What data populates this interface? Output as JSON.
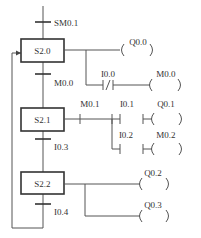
{
  "diagram": {
    "type": "SFC (sequential function chart)",
    "initial_transition": "SM0.1",
    "steps": [
      {
        "id": "S2.0",
        "label": "S2.0"
      },
      {
        "id": "S2.1",
        "label": "S2.1"
      },
      {
        "id": "S2.2",
        "label": "S2.2"
      }
    ],
    "transitions": [
      {
        "label": "SM0.1",
        "from": "start",
        "to": "S2.0"
      },
      {
        "label": "M0.0",
        "from": "S2.0",
        "to": "S2.1"
      },
      {
        "label": "I0.3",
        "from": "S2.1",
        "to": "S2.2"
      },
      {
        "label": "I0.4",
        "from": "S2.2",
        "to": "S2.0"
      }
    ],
    "actions": {
      "s20": {
        "coil1": "Q0.0",
        "contact_nc": "I0.0",
        "coil2": "M0.0"
      },
      "s21": {
        "contact_m": "M0.1",
        "contact_a": "I0.1",
        "coil_a": "Q0.1",
        "contact_b": "I0.2",
        "coil_b": "M0.2"
      },
      "s22": {
        "coil1": "Q0.2",
        "coil2": "Q0.3"
      }
    }
  }
}
